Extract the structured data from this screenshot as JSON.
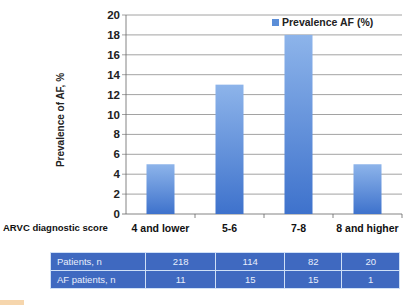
{
  "chart_data": {
    "type": "bar",
    "title": "",
    "xlabel": "ARVC diagnostic score",
    "ylabel": "Prevalence of AF, %",
    "categories": [
      "4 and lower",
      "5-6",
      "7-8",
      "8 and higher"
    ],
    "series": [
      {
        "name": "Prevalence AF (%)",
        "values": [
          5,
          13,
          18,
          5
        ],
        "color": "#5b8ed8"
      }
    ],
    "ylim": [
      0,
      20
    ],
    "yticks": [
      0,
      2,
      4,
      6,
      8,
      10,
      12,
      14,
      16,
      18,
      20
    ],
    "grid": true,
    "legend_position": "top-right",
    "table": {
      "rows": [
        {
          "label": "Patients, n",
          "values": [
            "218",
            "114",
            "82",
            "20"
          ]
        },
        {
          "label": "AF patients, n",
          "values": [
            "11",
            "15",
            "15",
            "1"
          ]
        }
      ]
    }
  },
  "axis": {
    "ylabel": "Prevalence of AF, %",
    "xlabel": "ARVC diagnostic score"
  },
  "legend": {
    "label": "Prevalence AF (%)"
  },
  "colors": {
    "bar_top": "#8db4ea",
    "bar_bottom": "#3e72cc",
    "table_bg": "#3f69c0",
    "grid": "#8a8a8a"
  }
}
